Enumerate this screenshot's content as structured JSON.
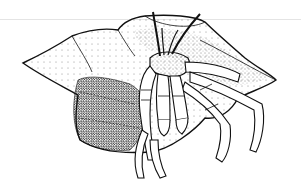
{
  "illustration": {
    "subject": "hermit crab in a spiral shell",
    "style": "black-and-white stippled pen illustration",
    "colors": {
      "ink": "#111111",
      "paper": "#ffffff",
      "rule": "#e4e4e4"
    }
  }
}
